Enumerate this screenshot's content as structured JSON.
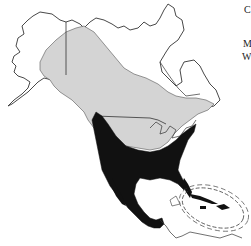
{
  "map": {
    "title": "North America species range map",
    "legend_labels": [
      "C",
      "M",
      "W"
    ],
    "colors": {
      "background": "#ffffff",
      "breeding_range": "#d4d4d4",
      "year_round_range": "#111111",
      "outline": "#333333"
    },
    "regions": [
      {
        "name": "summer-breeding-range",
        "fill": "light-gray"
      },
      {
        "name": "year-round-range",
        "fill": "black"
      },
      {
        "name": "caribbean-circled-region",
        "style": "dashed-ellipse"
      }
    ]
  }
}
